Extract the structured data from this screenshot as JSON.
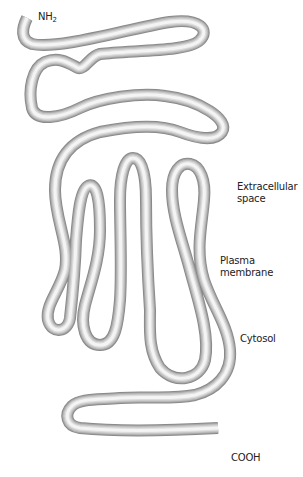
{
  "figure": {
    "type": "protein-topology-diagram",
    "colors": {
      "background": "#ffffff",
      "tube_outer": "#8a8a8a",
      "tube_mid": "#c4c4c4",
      "tube_core": "#f4f4f4",
      "label_text": "#222222"
    }
  },
  "labels": {
    "n_terminus": {
      "main": "NH",
      "sub": "2"
    },
    "extracellular": {
      "line1": "Extracellular",
      "line2": "space"
    },
    "membrane": {
      "line1": "Plasma",
      "line2": "membrane"
    },
    "cytosol": "Cytosol",
    "c_terminus": "COOH"
  },
  "structure": {
    "transmembrane_helices": 7,
    "termini": [
      "NH2 (extracellular)",
      "COOH (cytosolic)"
    ]
  }
}
